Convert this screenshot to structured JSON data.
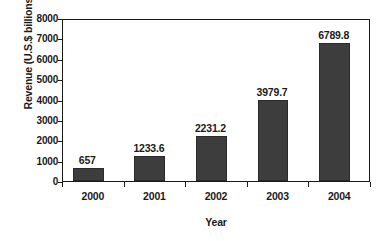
{
  "chart_data": {
    "type": "bar",
    "title": "",
    "categories": [
      "2000",
      "2001",
      "2002",
      "2003",
      "2004"
    ],
    "values": [
      657,
      1233.6,
      2231.2,
      3979.7,
      6789.8
    ],
    "value_labels": [
      "657",
      "1233.6",
      "2231.2",
      "3979.7",
      "6789.8"
    ],
    "xlabel": "Year",
    "ylabel": "Revenue (U.S.$ billions)",
    "ylim": [
      0,
      8000
    ],
    "yticks": [
      0,
      1000,
      2000,
      3000,
      4000,
      5000,
      6000,
      7000,
      8000
    ],
    "ytick_labels": [
      "0",
      "1000",
      "2000",
      "3000",
      "4000",
      "5000",
      "6000",
      "7000",
      "8000"
    ],
    "grid": false,
    "legend": "none",
    "bar_color": "#3d3d3d",
    "axis_color": "#1a1a1a",
    "background_color": "#ffffff"
  }
}
